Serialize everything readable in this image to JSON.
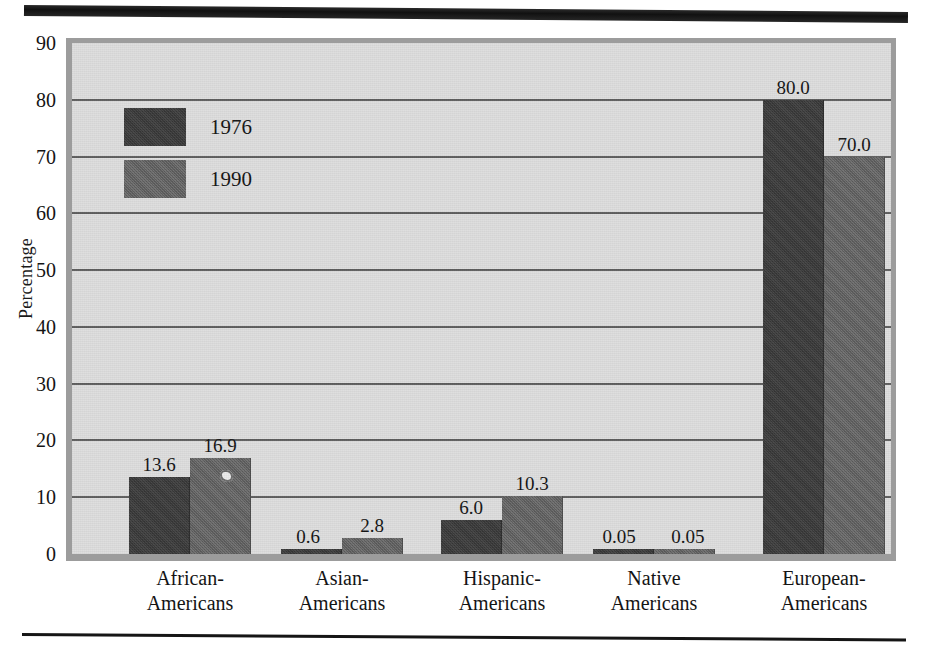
{
  "chart_data": {
    "type": "bar",
    "title": "",
    "subtitle": "",
    "xlabel": "",
    "ylabel": "Percentage",
    "ylim": [
      0,
      90
    ],
    "yticks": [
      "0",
      "10",
      "20",
      "30",
      "40",
      "50",
      "60",
      "70",
      "80",
      "90"
    ],
    "grid": true,
    "legend_position": "inside-top-left",
    "categories": [
      "African-Americans",
      "Asian-Americans",
      "Hispanic-Americans",
      "Native Americans",
      "European-Americans"
    ],
    "category_lines": [
      {
        "line1": "African-",
        "line2": "Americans"
      },
      {
        "line1": "Asian-",
        "line2": "Americans"
      },
      {
        "line1": "Hispanic-",
        "line2": "Americans"
      },
      {
        "line1": "Native",
        "line2": "Americans"
      },
      {
        "line1": "European-",
        "line2": "Americans"
      }
    ],
    "series": [
      {
        "name": "1976",
        "color": "#3b3b3b",
        "values": [
          13.6,
          0.6,
          6.0,
          0.05,
          80.0
        ],
        "labels": [
          "13.6",
          "0.6",
          "6.0",
          "0.05",
          "80.0"
        ]
      },
      {
        "name": "1990",
        "color": "#646464",
        "values": [
          16.9,
          2.8,
          10.3,
          0.05,
          70.0
        ],
        "labels": [
          "16.9",
          "2.8",
          "10.3",
          "0.05",
          "70.0"
        ]
      }
    ]
  },
  "legend": {
    "entries": [
      {
        "label": "1976"
      },
      {
        "label": "1990"
      }
    ]
  },
  "axis": {
    "y_title": "Percentage"
  },
  "colors": {
    "series_1976": "#3b3b3b",
    "series_1990": "#646464",
    "plot_background": "#dedede",
    "plot_frame": "#9c9c9c",
    "gridline": "#5f5f5f",
    "rule": "#1b1b1b",
    "page_background": "#ffffff"
  }
}
